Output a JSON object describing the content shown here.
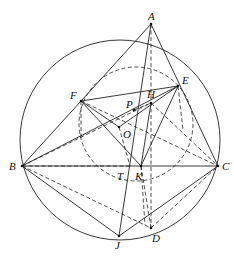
{
  "diagram": {
    "type": "geometry",
    "circumcircle": {
      "cx": 120,
      "cy": 140,
      "r": 100
    },
    "nine_point_circle": {
      "cx": 136,
      "cy": 124,
      "r": 57
    },
    "points": {
      "A": {
        "x": 151,
        "y": 24,
        "label": "A"
      },
      "B": {
        "x": 22,
        "y": 166,
        "label": "B"
      },
      "C": {
        "x": 218,
        "y": 166,
        "label": "C"
      },
      "E": {
        "x": 178,
        "y": 86,
        "label": "E"
      },
      "F": {
        "x": 81,
        "y": 101,
        "label": "F"
      },
      "H": {
        "x": 151,
        "y": 103,
        "label": "H"
      },
      "P": {
        "x": 134,
        "y": 110,
        "label": "P"
      },
      "O": {
        "x": 119,
        "y": 127,
        "label": "O"
      },
      "T": {
        "x": 130,
        "y": 166,
        "label": "T"
      },
      "K": {
        "x": 141,
        "y": 166,
        "label": "K"
      },
      "J": {
        "x": 119,
        "y": 236,
        "label": "J"
      },
      "D": {
        "x": 151,
        "y": 228,
        "label": "D"
      }
    }
  }
}
